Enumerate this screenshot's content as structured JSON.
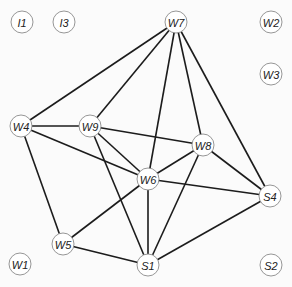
{
  "diagram": {
    "type": "graph",
    "node_radius": 11,
    "nodes": [
      {
        "id": "I1",
        "label": "I1",
        "x": 22,
        "y": 22
      },
      {
        "id": "I3",
        "label": "I3",
        "x": 64,
        "y": 22
      },
      {
        "id": "W7",
        "label": "W7",
        "x": 176,
        "y": 22
      },
      {
        "id": "W2",
        "label": "W2",
        "x": 271,
        "y": 22
      },
      {
        "id": "W3",
        "label": "W3",
        "x": 271,
        "y": 74
      },
      {
        "id": "W4",
        "label": "W4",
        "x": 21,
        "y": 126
      },
      {
        "id": "W9",
        "label": "W9",
        "x": 90,
        "y": 126
      },
      {
        "id": "W8",
        "label": "W8",
        "x": 203,
        "y": 145
      },
      {
        "id": "W6",
        "label": "W6",
        "x": 148,
        "y": 179
      },
      {
        "id": "S4",
        "label": "S4",
        "x": 270,
        "y": 196
      },
      {
        "id": "W5",
        "label": "W5",
        "x": 63,
        "y": 244
      },
      {
        "id": "W1",
        "label": "W1",
        "x": 20,
        "y": 264
      },
      {
        "id": "S1",
        "label": "S1",
        "x": 148,
        "y": 265
      },
      {
        "id": "S2",
        "label": "S2",
        "x": 271,
        "y": 265
      }
    ],
    "edges": [
      [
        "W7",
        "W4"
      ],
      [
        "W7",
        "W9"
      ],
      [
        "W7",
        "W6"
      ],
      [
        "W7",
        "W8"
      ],
      [
        "W7",
        "S4"
      ],
      [
        "W4",
        "W9"
      ],
      [
        "W4",
        "W6"
      ],
      [
        "W4",
        "W5"
      ],
      [
        "W9",
        "W8"
      ],
      [
        "W9",
        "W6"
      ],
      [
        "W9",
        "S1"
      ],
      [
        "W8",
        "W6"
      ],
      [
        "W8",
        "S4"
      ],
      [
        "W8",
        "S1"
      ],
      [
        "W6",
        "S4"
      ],
      [
        "W6",
        "S1"
      ],
      [
        "W6",
        "W5"
      ],
      [
        "W5",
        "S1"
      ],
      [
        "S1",
        "S4"
      ]
    ]
  }
}
